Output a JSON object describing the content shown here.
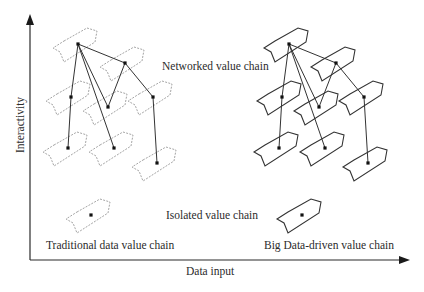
{
  "axes": {
    "x_label": "Data input",
    "y_label": "Interactivity",
    "origin": [
      30,
      260
    ],
    "x_end": 410,
    "y_end": 14,
    "color": "#2a2a2a"
  },
  "labels": {
    "networked": "Networked value chain",
    "isolated": "Isolated value chain",
    "traditional": "Traditional data value chain",
    "big_data": "Big Data-driven value chain"
  },
  "chevron_shape": [
    [
      -14,
      -3
    ],
    [
      9,
      -16
    ],
    [
      19,
      -13
    ],
    [
      17,
      -2
    ],
    [
      -14,
      18
    ],
    [
      -18,
      8
    ],
    [
      -25,
      4
    ]
  ],
  "panels": [
    {
      "name": "traditional",
      "style": "dashed",
      "stroke": "#9a9a9a",
      "offset_x": 0,
      "network_nodes": [
        [
          78,
          44
        ],
        [
          125,
          63
        ],
        [
          71,
          97
        ],
        [
          108,
          107
        ],
        [
          153,
          97
        ],
        [
          68,
          148
        ],
        [
          114,
          148
        ],
        [
          157,
          163
        ]
      ],
      "isolated_node": [
        91,
        215
      ]
    },
    {
      "name": "big-data",
      "style": "solid",
      "stroke": "#333333",
      "offset_x": 211,
      "network_nodes": [
        [
          78,
          44
        ],
        [
          125,
          63
        ],
        [
          71,
          97
        ],
        [
          108,
          107
        ],
        [
          153,
          97
        ],
        [
          68,
          148
        ],
        [
          114,
          148
        ],
        [
          157,
          163
        ]
      ],
      "isolated_node": [
        91,
        215
      ]
    }
  ],
  "edges": [
    [
      0,
      1
    ],
    [
      0,
      2
    ],
    [
      0,
      3
    ],
    [
      0,
      6
    ],
    [
      1,
      3
    ],
    [
      1,
      4
    ],
    [
      2,
      5
    ],
    [
      4,
      7
    ]
  ]
}
